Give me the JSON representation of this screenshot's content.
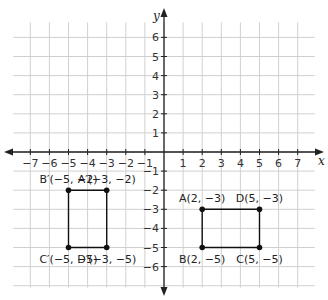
{
  "chart_data": {
    "type": "scatter",
    "title": "",
    "xlabel": "x",
    "ylabel": "y",
    "xlim": [
      -8,
      8
    ],
    "ylim": [
      -7,
      7
    ],
    "grid": true,
    "x_ticks": [
      -7,
      -6,
      -5,
      -4,
      -3,
      -2,
      -1,
      1,
      2,
      3,
      4,
      5,
      6,
      7
    ],
    "y_ticks": [
      6,
      5,
      4,
      3,
      2,
      1,
      -1,
      -2,
      -3,
      -4,
      -5,
      -6
    ],
    "tick_labels_x": [
      "−7",
      "−6",
      "−5",
      "−4",
      "−3",
      "−2",
      "−1",
      "1",
      "2",
      "3",
      "4",
      "5",
      "6",
      "7"
    ],
    "tick_labels_y": [
      "6",
      "5",
      "4",
      "3",
      "2",
      "1",
      "−1",
      "−2",
      "−3",
      "−4",
      "−5",
      "−6"
    ],
    "series": [
      {
        "name": "Rectangle ABCD",
        "points": [
          {
            "label": "A(2, −3)",
            "x": 2,
            "y": -3
          },
          {
            "label": "D(5, −3)",
            "x": 5,
            "y": -3
          },
          {
            "label": "C(5, −5)",
            "x": 5,
            "y": -5
          },
          {
            "label": "B(2, −5)",
            "x": 2,
            "y": -5
          }
        ]
      },
      {
        "name": "Rectangle A'B'C'D'",
        "points": [
          {
            "label": "B′(−5, −2)",
            "x": -5,
            "y": -2
          },
          {
            "label": "A′(−3, −2)",
            "x": -3,
            "y": -2
          },
          {
            "label": "D′(−3, −5)",
            "x": -3,
            "y": -5
          },
          {
            "label": "C′(−5, −5)",
            "x": -5,
            "y": -5
          }
        ]
      }
    ]
  },
  "colors": {
    "grid": "#d0d0d0",
    "axis": "#222222",
    "shape": "#111111"
  }
}
